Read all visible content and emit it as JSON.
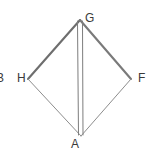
{
  "figure": {
    "type": "geometry-diagram",
    "canvas": {
      "width": 153,
      "height": 161,
      "background": "#ffffff"
    },
    "vertices": [
      {
        "id": "G",
        "label": "G",
        "x": 80,
        "y": 20,
        "label_x": 85,
        "label_y": 12
      },
      {
        "id": "H",
        "label": "H",
        "x": 28,
        "y": 79,
        "label_x": 17,
        "label_y": 72
      },
      {
        "id": "F",
        "label": "F",
        "x": 131,
        "y": 79,
        "label_x": 138,
        "label_y": 72
      },
      {
        "id": "A",
        "label": "A",
        "x": 81,
        "y": 136,
        "label_x": 71,
        "label_y": 138
      },
      {
        "id": "B",
        "label": "B",
        "x": 0,
        "y": 79,
        "label_x": -4,
        "label_y": 72,
        "clipped": true
      }
    ],
    "edges": [
      {
        "id": "HG",
        "from": "H",
        "to": "G",
        "color": "#6e6e6e",
        "width": 2.1
      },
      {
        "id": "GF",
        "from": "G",
        "to": "F",
        "color": "#7a7a7a",
        "width": 2.1
      },
      {
        "id": "HA",
        "from": "H",
        "to": "A",
        "color": "#8d8d8d",
        "width": 1.0
      },
      {
        "id": "AF",
        "from": "A",
        "to": "F",
        "color": "#8d8d8d",
        "width": 1.0
      }
    ],
    "interior_lines": [
      {
        "id": "GA-left",
        "x1": 77.5,
        "y1": 21,
        "x2": 78.5,
        "y2": 135,
        "color": "#7d7d7d",
        "width": 1.0
      },
      {
        "id": "GA-right",
        "x1": 82.5,
        "y1": 21,
        "x2": 83.0,
        "y2": 135,
        "color": "#7d7d7d",
        "width": 1.0
      }
    ],
    "colors": {
      "stroke_dark": "#6e6e6e",
      "stroke_light": "#8d8d8d",
      "label_text": "#3a3a3a",
      "background": "#ffffff"
    }
  }
}
